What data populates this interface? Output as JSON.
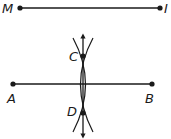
{
  "diagram": {
    "segment_top": {
      "start_label": "M",
      "end_label": "I"
    },
    "segment_main": {
      "start_label": "A",
      "end_label": "B"
    },
    "bisector": {
      "top_label": "C",
      "bottom_label": "D"
    },
    "colors": {
      "stroke": "#1a1a1a",
      "background": "#ffffff"
    }
  }
}
